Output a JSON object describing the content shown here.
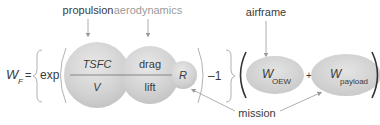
{
  "labels": {
    "propulsion": "propulsion",
    "aerodynamics": "aerodynamics",
    "airframe": "airframe",
    "mission": "mission"
  },
  "equation": {
    "lhs_main": "W",
    "lhs_sub": "F",
    "equals": "=",
    "exp": "exp",
    "minus_one": "–1",
    "plus": "+"
  },
  "terms": {
    "tsfc_numerator": "TSFC",
    "tsfc_denominator": "V",
    "drag_numerator": "drag",
    "drag_denominator": "lift",
    "range": "R",
    "oew_main": "W",
    "oew_sub": "OEW",
    "payload_main": "W",
    "payload_sub": "payload"
  },
  "colors": {
    "bubble_fill": "#cfcfcf",
    "bubble_highlight": "#e6e6e6",
    "text": "#3a3a3a",
    "label_light": "#9a9a9a",
    "arrow": "#9a9a9a",
    "bracket": "#a8a8a8"
  }
}
